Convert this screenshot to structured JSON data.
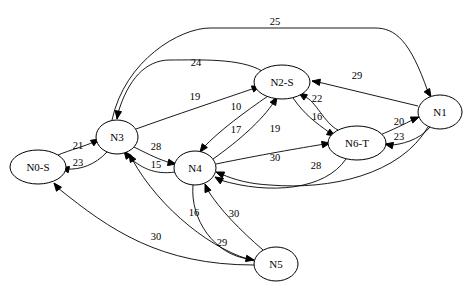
{
  "graph": {
    "type": "directed-weighted",
    "nodes": [
      {
        "id": "N0-S",
        "label": "N0-S"
      },
      {
        "id": "N3",
        "label": "N3"
      },
      {
        "id": "N2-S",
        "label": "N2-S"
      },
      {
        "id": "N4",
        "label": "N4"
      },
      {
        "id": "N6-T",
        "label": "N6-T"
      },
      {
        "id": "N1",
        "label": "N1"
      },
      {
        "id": "N5",
        "label": "N5"
      }
    ],
    "edges": [
      {
        "from": "N3",
        "to": "N1",
        "weight": "25"
      },
      {
        "from": "N2-S",
        "to": "N3",
        "weight": "24"
      },
      {
        "from": "N3",
        "to": "N2-S",
        "weight": "19"
      },
      {
        "from": "N0-S",
        "to": "N3",
        "weight": "21"
      },
      {
        "from": "N3",
        "to": "N0-S",
        "weight": "23"
      },
      {
        "from": "N3",
        "to": "N4",
        "weight": "28"
      },
      {
        "from": "N4",
        "to": "N3",
        "weight": "15"
      },
      {
        "from": "N2-S",
        "to": "N4",
        "weight": "10"
      },
      {
        "from": "N4",
        "to": "N2-S",
        "weight": "17"
      },
      {
        "from": "N2-S",
        "to": "N6-T",
        "weight": "16"
      },
      {
        "from": "N6-T",
        "to": "N2-S",
        "weight": "22"
      },
      {
        "from": "N1",
        "to": "N2-S",
        "weight": "29"
      },
      {
        "from": "N4",
        "to": "N6-T",
        "weight": "19"
      },
      {
        "from": "N6-T",
        "to": "N4",
        "weight": "30"
      },
      {
        "from": "N1",
        "to": "N4",
        "weight": "28"
      },
      {
        "from": "N6-T",
        "to": "N1",
        "weight": "20"
      },
      {
        "from": "N1",
        "to": "N6-T",
        "weight": "23"
      },
      {
        "from": "N4",
        "to": "N5",
        "weight": "29"
      },
      {
        "from": "N5",
        "to": "N4",
        "weight": "30"
      },
      {
        "from": "N5",
        "to": "N3",
        "weight": "16"
      },
      {
        "from": "N5",
        "to": "N0-S",
        "weight": "30"
      }
    ]
  }
}
